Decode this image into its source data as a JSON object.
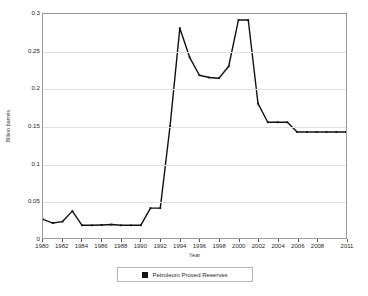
{
  "chart_data": {
    "type": "line",
    "title": "",
    "xlabel": "Year",
    "ylabel": "Billion barrels",
    "xlim": [
      1980,
      2011
    ],
    "ylim": [
      0,
      0.3
    ],
    "grid": true,
    "legend_position": "bottom",
    "y_ticks": [
      "0",
      "0.05",
      "0.1",
      "0.15",
      "0.2",
      "0.25",
      "0.3"
    ],
    "y_tick_values": [
      0,
      0.05,
      0.1,
      0.15,
      0.2,
      0.25,
      0.3
    ],
    "x_tick_labels": [
      "1980",
      "1982",
      "1984",
      "1986",
      "1988",
      "1990",
      "1992",
      "1994",
      "1996",
      "1998",
      "2000",
      "2002",
      "2004",
      "2006",
      "2008",
      "2011"
    ],
    "x_tick_values": [
      1980,
      1982,
      1984,
      1986,
      1988,
      1990,
      1992,
      1994,
      1996,
      1998,
      2000,
      2002,
      2004,
      2006,
      2008,
      2011
    ],
    "series": [
      {
        "name": "Petroleum Proved Reserves",
        "color": "#111111",
        "marker": "square",
        "x": [
          1980,
          1981,
          1982,
          1983,
          1984,
          1985,
          1986,
          1987,
          1988,
          1989,
          1990,
          1991,
          1992,
          1993,
          1994,
          1995,
          1996,
          1997,
          1998,
          1999,
          2000,
          2001,
          2002,
          2003,
          2004,
          2005,
          2006,
          2007,
          2008,
          2009,
          2010,
          2011
        ],
        "values": [
          0.025,
          0.02,
          0.022,
          0.036,
          0.017,
          0.017,
          0.0175,
          0.018,
          0.017,
          0.017,
          0.017,
          0.04,
          0.04,
          0.15,
          0.281,
          0.242,
          0.218,
          0.215,
          0.214,
          0.23,
          0.292,
          0.292,
          0.18,
          0.155,
          0.155,
          0.155,
          0.142,
          0.142,
          0.142,
          0.142,
          0.142,
          0.142
        ]
      }
    ]
  },
  "legend": {
    "items": [
      {
        "label": "Petroleum Proved Reserves",
        "color": "#111111"
      }
    ]
  },
  "axes": {
    "y_title": "Billion barrels",
    "x_title": "Year"
  }
}
